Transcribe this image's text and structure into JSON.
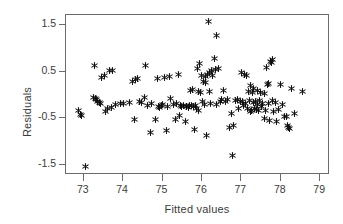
{
  "chart_data": {
    "type": "scatter",
    "title": "",
    "xlabel": "Fitted values",
    "ylabel": "Residuals",
    "marker": "asterisk",
    "marker_color": "#111111",
    "grid": false,
    "legend": null,
    "xlim": [
      72.55,
      79.25
    ],
    "ylim": [
      -1.72,
      1.72
    ],
    "xticks": [
      73,
      74,
      75,
      76,
      77,
      78,
      79
    ],
    "xticklabels": [
      "73",
      "74",
      "75",
      "76",
      "77",
      "78",
      "79"
    ],
    "yticks": [
      1.5,
      0.5,
      -0.5,
      -1.5
    ],
    "yticklabels": [
      "1.5",
      "0.5",
      "-0.5",
      "-1.5"
    ],
    "n_points": 152,
    "points": [
      [
        72.86,
        -0.34
      ],
      [
        72.92,
        -0.41
      ],
      [
        72.95,
        -0.44
      ],
      [
        73.05,
        -1.54
      ],
      [
        73.28,
        0.64
      ],
      [
        73.26,
        -0.05
      ],
      [
        73.3,
        -0.08
      ],
      [
        73.33,
        -0.1
      ],
      [
        73.36,
        -0.13
      ],
      [
        73.4,
        -0.16
      ],
      [
        73.42,
        -0.19
      ],
      [
        73.46,
        0.38
      ],
      [
        73.52,
        0.42
      ],
      [
        73.55,
        -0.35
      ],
      [
        73.61,
        -0.29
      ],
      [
        73.66,
        0.53
      ],
      [
        73.7,
        -0.26
      ],
      [
        73.74,
        0.52
      ],
      [
        73.8,
        -0.21
      ],
      [
        73.93,
        -0.19
      ],
      [
        74.02,
        -0.18
      ],
      [
        74.15,
        -0.17
      ],
      [
        74.24,
        0.3
      ],
      [
        74.3,
        -0.52
      ],
      [
        74.32,
        0.34
      ],
      [
        74.37,
        0.36
      ],
      [
        74.41,
        -0.14
      ],
      [
        74.46,
        -0.16
      ],
      [
        74.57,
        0.64
      ],
      [
        74.55,
        -0.05
      ],
      [
        74.62,
        -0.22
      ],
      [
        74.7,
        -0.81
      ],
      [
        74.72,
        -0.19
      ],
      [
        74.83,
        -0.53
      ],
      [
        74.88,
        0.36
      ],
      [
        74.9,
        -0.25
      ],
      [
        74.93,
        -0.27
      ],
      [
        74.97,
        -0.22
      ],
      [
        75.0,
        -0.2
      ],
      [
        75.06,
        0.37
      ],
      [
        75.1,
        -0.76
      ],
      [
        75.12,
        -0.24
      ],
      [
        75.17,
        0.39
      ],
      [
        75.2,
        -0.08
      ],
      [
        75.28,
        -0.21
      ],
      [
        75.33,
        -0.52
      ],
      [
        75.36,
        -0.18
      ],
      [
        75.4,
        0.45
      ],
      [
        75.42,
        -0.44
      ],
      [
        75.45,
        -0.22
      ],
      [
        75.49,
        -0.25
      ],
      [
        75.53,
        -0.22
      ],
      [
        75.58,
        -0.58
      ],
      [
        75.6,
        -0.24
      ],
      [
        75.62,
        -0.25
      ],
      [
        75.66,
        -0.26
      ],
      [
        75.68,
        -0.22
      ],
      [
        75.7,
        0.09
      ],
      [
        75.73,
        -0.23
      ],
      [
        75.76,
        0.12
      ],
      [
        75.79,
        -0.25
      ],
      [
        75.8,
        -0.74
      ],
      [
        75.84,
        -0.22
      ],
      [
        75.86,
        -0.3
      ],
      [
        75.88,
        0.56
      ],
      [
        75.9,
        0.08
      ],
      [
        75.92,
        -0.33
      ],
      [
        75.95,
        0.68
      ],
      [
        75.97,
        0.06
      ],
      [
        76.0,
        0.43
      ],
      [
        76.02,
        -0.14
      ],
      [
        76.04,
        0.3
      ],
      [
        76.06,
        -0.21
      ],
      [
        76.08,
        0.4
      ],
      [
        76.1,
        0.26
      ],
      [
        76.12,
        -0.88
      ],
      [
        76.15,
        0.45
      ],
      [
        76.17,
        1.57
      ],
      [
        76.18,
        0.07
      ],
      [
        76.2,
        0.48
      ],
      [
        76.22,
        -0.19
      ],
      [
        76.25,
        0.52
      ],
      [
        76.28,
        0.42
      ],
      [
        76.32,
        0.78
      ],
      [
        76.34,
        0.55
      ],
      [
        76.37,
        -0.2
      ],
      [
        76.38,
        1.27
      ],
      [
        76.42,
        0.57
      ],
      [
        76.46,
        -0.13
      ],
      [
        76.5,
        -0.1
      ],
      [
        76.55,
        0.1
      ],
      [
        76.6,
        -0.15
      ],
      [
        76.65,
        -0.09
      ],
      [
        76.7,
        -0.7
      ],
      [
        76.74,
        -0.4
      ],
      [
        76.78,
        -1.3
      ],
      [
        76.8,
        -0.66
      ],
      [
        76.85,
        -0.12
      ],
      [
        76.9,
        -0.1
      ],
      [
        76.93,
        -0.3
      ],
      [
        76.97,
        -0.14
      ],
      [
        77.0,
        0.48
      ],
      [
        77.02,
        -0.13
      ],
      [
        77.05,
        -0.22
      ],
      [
        77.08,
        0.44
      ],
      [
        77.1,
        -0.18
      ],
      [
        77.13,
        0.42
      ],
      [
        77.16,
        -0.3
      ],
      [
        77.18,
        0.08
      ],
      [
        77.2,
        -0.12
      ],
      [
        77.22,
        -0.35
      ],
      [
        77.24,
        0.2
      ],
      [
        77.26,
        -0.33
      ],
      [
        77.28,
        0.06
      ],
      [
        77.3,
        -0.16
      ],
      [
        77.32,
        0.14
      ],
      [
        77.34,
        -0.28
      ],
      [
        77.36,
        -0.14
      ],
      [
        77.38,
        -0.31
      ],
      [
        77.4,
        0.1
      ],
      [
        77.42,
        -0.2
      ],
      [
        77.44,
        -0.34
      ],
      [
        77.46,
        -0.12
      ],
      [
        77.48,
        0.05
      ],
      [
        77.5,
        -0.24
      ],
      [
        77.54,
        -0.19
      ],
      [
        77.58,
        -0.5
      ],
      [
        77.6,
        0.04
      ],
      [
        77.62,
        -0.34
      ],
      [
        77.64,
        0.6
      ],
      [
        77.66,
        0.22
      ],
      [
        77.68,
        -0.18
      ],
      [
        77.7,
        0.24
      ],
      [
        77.72,
        -0.55
      ],
      [
        77.74,
        0.72
      ],
      [
        77.76,
        0.7
      ],
      [
        77.78,
        0.76
      ],
      [
        77.8,
        -0.12
      ],
      [
        77.82,
        -0.36
      ],
      [
        77.86,
        -0.16
      ],
      [
        77.9,
        -0.56
      ],
      [
        77.94,
        -0.32
      ],
      [
        78.0,
        0.22
      ],
      [
        78.05,
        -0.2
      ],
      [
        78.1,
        -0.46
      ],
      [
        78.14,
        -0.46
      ],
      [
        78.16,
        -0.66
      ],
      [
        78.2,
        -0.7
      ],
      [
        78.22,
        -0.72
      ],
      [
        78.28,
        0.14
      ],
      [
        78.35,
        -0.4
      ],
      [
        78.55,
        0.08
      ]
    ]
  }
}
